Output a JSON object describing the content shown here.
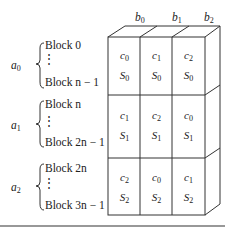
{
  "columns": [
    {
      "var": "b",
      "sub": "0"
    },
    {
      "var": "b",
      "sub": "1"
    },
    {
      "var": "b",
      "sub": "2"
    }
  ],
  "groups": [
    {
      "var": "a",
      "sub": "0",
      "first": "Block 0",
      "last": "Block n − 1",
      "cells": [
        {
          "c": "0",
          "s": "0"
        },
        {
          "c": "1",
          "s": "0"
        },
        {
          "c": "2",
          "s": "0"
        }
      ]
    },
    {
      "var": "a",
      "sub": "1",
      "first": "Block n",
      "last": "Block 2n − 1",
      "cells": [
        {
          "c": "1",
          "s": "1"
        },
        {
          "c": "2",
          "s": "1"
        },
        {
          "c": "0",
          "s": "1"
        }
      ]
    },
    {
      "var": "a",
      "sub": "2",
      "first": "Block 2n",
      "last": "Block 3n − 1",
      "cells": [
        {
          "c": "2",
          "s": "2"
        },
        {
          "c": "0",
          "s": "2"
        },
        {
          "c": "1",
          "s": "2"
        }
      ]
    }
  ],
  "symbols": {
    "c": "c",
    "s": "S",
    "vdots": "⋮"
  }
}
